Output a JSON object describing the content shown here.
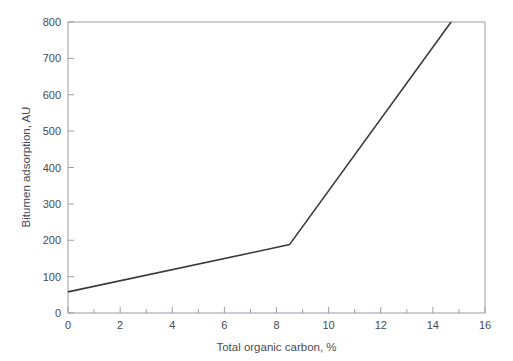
{
  "figure": {
    "background_color": "#ffffff",
    "axis_color": "#9a9aa8",
    "text_color": "#4a4a52",
    "series_color": "#3a3a3a"
  },
  "chart_data": {
    "type": "line",
    "title": "",
    "xlabel": "Total organic carbon, %",
    "ylabel": "Bitumen adsorption, AU",
    "xlim": [
      0,
      16
    ],
    "ylim": [
      0,
      800
    ],
    "grid": false,
    "legend": null,
    "xticks": [
      0,
      2,
      4,
      6,
      8,
      10,
      12,
      14,
      16
    ],
    "xtick_labels": [
      "0",
      "2",
      "4",
      "6",
      "8",
      "10",
      "12",
      "14",
      "16"
    ],
    "xminor_ticks": [
      1,
      3,
      5,
      7,
      9,
      11,
      13,
      15
    ],
    "yticks": [
      0,
      100,
      200,
      300,
      400,
      500,
      600,
      700,
      800
    ],
    "ytick_labels": [
      "0",
      "100",
      "200",
      "300",
      "400",
      "500",
      "600",
      "700",
      "800"
    ],
    "yminor_ticks": [],
    "series": [
      {
        "name": "Bitumen adsorption",
        "x": [
          0,
          8.5,
          14.7
        ],
        "values": [
          58,
          188,
          800
        ]
      }
    ],
    "annotations": []
  }
}
